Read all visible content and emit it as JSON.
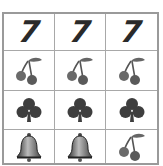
{
  "reels": {
    "rows": [
      [
        "seven",
        "seven",
        "seven"
      ],
      [
        "cherry",
        "cherry",
        "cherry"
      ],
      [
        "club",
        "club",
        "club"
      ],
      [
        "bell",
        "bell",
        "cherry"
      ]
    ],
    "seven_label": "7"
  },
  "colors": {
    "grid_line": "#a8a8a8",
    "symbol": "#4a4a4a"
  }
}
